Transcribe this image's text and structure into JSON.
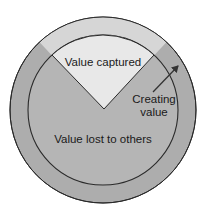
{
  "diagram": {
    "type": "concentric-circle-with-wedge",
    "labels": {
      "value_captured": "Value captured",
      "creating_value_line1": "Creating",
      "creating_value_line2": "value",
      "value_lost": "Value lost to others"
    },
    "colors": {
      "outer_ring": "#adadad",
      "outer_ring_wedge": "#d6d6d6",
      "inner_circle": "#b5b5b5",
      "captured_wedge": "#e8e8e8",
      "stroke": "#2a2a2a",
      "arrow": "#333333"
    }
  }
}
